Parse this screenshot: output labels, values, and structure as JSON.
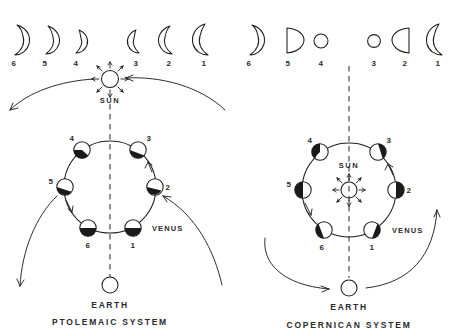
{
  "figure": {
    "background_color": "#ffffff",
    "ink_color": "#1a1a1a"
  },
  "panels": [
    {
      "id": "ptolemaic",
      "caption": "PTOLEMAIC   SYSTEM",
      "center_label": "SUN",
      "orbiting_body_label": "VENUS",
      "observer_label": "EARTH",
      "phase_row": {
        "description": "Phases of Venus as seen from Earth in the Ptolemaic system",
        "items": [
          {
            "number": "6",
            "shape": "crescent-right",
            "size": 1.0,
            "illuminated_side": "right"
          },
          {
            "number": "5",
            "shape": "crescent-right",
            "size": 0.92,
            "illuminated_side": "right"
          },
          {
            "number": "4",
            "shape": "crescent-right",
            "size": 0.74,
            "illuminated_side": "right"
          },
          {
            "number": "3",
            "shape": "crescent-left",
            "size": 0.78,
            "illuminated_side": "left"
          },
          {
            "number": "2",
            "shape": "crescent-left",
            "size": 0.93,
            "illuminated_side": "left"
          },
          {
            "number": "1",
            "shape": "crescent-left",
            "size": 1.04,
            "illuminated_side": "left"
          }
        ]
      },
      "orbit_positions": [
        {
          "number": "1",
          "angle_deg": 62,
          "dark_side": "bottom"
        },
        {
          "number": "2",
          "angle_deg": 7,
          "dark_side": "bottom-right"
        },
        {
          "number": "3",
          "angle_deg": -50,
          "dark_side": "bottom-right"
        },
        {
          "number": "4",
          "angle_deg": -128,
          "dark_side": "bottom-left"
        },
        {
          "number": "5",
          "angle_deg": 178,
          "dark_side": "left"
        },
        {
          "number": "6",
          "angle_deg": 118,
          "dark_side": "bottom"
        }
      ]
    },
    {
      "id": "copernican",
      "caption": "COPERNICAN   SYSTEM",
      "center_label": "SUN",
      "orbiting_body_label": "VENUS",
      "observer_label": "EARTH",
      "phase_row": {
        "description": "Phases of Venus as seen from Earth in the Copernican system",
        "items": [
          {
            "number": "6",
            "shape": "crescent-right",
            "size": 1.0,
            "illuminated_side": "right"
          },
          {
            "number": "5",
            "shape": "half-right",
            "size": 0.88,
            "illuminated_side": "right"
          },
          {
            "number": "4",
            "shape": "full-small",
            "size": 0.55,
            "illuminated_side": "full"
          },
          {
            "number": "3",
            "shape": "full-small",
            "size": 0.5,
            "illuminated_side": "full"
          },
          {
            "number": "2",
            "shape": "half-left",
            "size": 0.88,
            "illuminated_side": "left"
          },
          {
            "number": "1",
            "shape": "crescent-left",
            "size": 1.04,
            "illuminated_side": "left"
          }
        ]
      },
      "orbit_positions": [
        {
          "number": "1",
          "angle_deg": 65,
          "dark_side": "bottom"
        },
        {
          "number": "2",
          "angle_deg": 0,
          "dark_side": "right"
        },
        {
          "number": "3",
          "angle_deg": -58,
          "dark_side": "top-right"
        },
        {
          "number": "4",
          "angle_deg": -122,
          "dark_side": "top-left"
        },
        {
          "number": "5",
          "angle_deg": 180,
          "dark_side": "left"
        },
        {
          "number": "6",
          "angle_deg": 115,
          "dark_side": "bottom-left"
        }
      ]
    }
  ]
}
